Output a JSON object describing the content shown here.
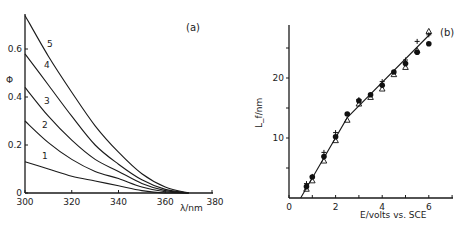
{
  "chart_data": [
    {
      "panel": "(a)",
      "type": "line",
      "title": "",
      "xlabel": "λ/nm",
      "ylabel": "Φ",
      "xlim": [
        300,
        380
      ],
      "ylim": [
        0,
        0.75
      ],
      "xticks": [
        300,
        320,
        340,
        360,
        380
      ],
      "yticks": [
        0,
        0.2,
        0.4,
        0.6
      ],
      "ytick_labels": [
        "0",
        "0.2",
        "0.4",
        "0.6"
      ],
      "grid": false,
      "x": [
        300,
        310,
        320,
        330,
        340,
        350,
        360,
        370
      ],
      "series": [
        {
          "name": "1",
          "values": [
            0.13,
            0.1,
            0.07,
            0.05,
            0.03,
            0.01,
            0.0,
            0.0
          ]
        },
        {
          "name": "2",
          "values": [
            0.3,
            0.21,
            0.14,
            0.09,
            0.06,
            0.025,
            0.005,
            0.0
          ]
        },
        {
          "name": "3",
          "values": [
            0.44,
            0.32,
            0.22,
            0.14,
            0.09,
            0.04,
            0.01,
            0.0
          ]
        },
        {
          "name": "4",
          "values": [
            0.58,
            0.45,
            0.32,
            0.2,
            0.12,
            0.055,
            0.015,
            0.0
          ]
        },
        {
          "name": "5",
          "values": [
            0.74,
            0.57,
            0.42,
            0.28,
            0.17,
            0.08,
            0.025,
            0.0
          ]
        }
      ]
    },
    {
      "panel": "(b)",
      "type": "scatter",
      "title": "",
      "xlabel": "E/volts  vs. SCE",
      "ylabel": "L_f/nm",
      "xlim": [
        0,
        7
      ],
      "ylim": [
        0,
        29
      ],
      "xticks": [
        0,
        1,
        2,
        3,
        4,
        5,
        6,
        7
      ],
      "xtick_labels": [
        "0",
        "",
        "2",
        "",
        "4",
        "",
        "6",
        ""
      ],
      "yticks": [
        5,
        10,
        15,
        20,
        25
      ],
      "ytick_labels": [
        "",
        "10",
        "",
        "20",
        ""
      ],
      "grid": false,
      "series": [
        {
          "name": "filled circles",
          "marker": "●",
          "x": [
            0.75,
            1.0,
            1.5,
            2.0,
            2.5,
            3.0,
            3.5,
            4.0,
            4.5,
            5.0,
            5.5,
            6.0
          ],
          "values": [
            1.9,
            3.5,
            6.9,
            10.2,
            14.0,
            16.2,
            17.2,
            18.8,
            21.0,
            22.4,
            24.3,
            25.7
          ]
        },
        {
          "name": "open triangles",
          "marker": "△",
          "x": [
            0.75,
            1.0,
            1.5,
            2.0,
            2.5,
            3.0,
            3.5,
            4.0,
            4.5,
            5.0,
            5.5,
            6.0
          ],
          "values": [
            1.5,
            2.9,
            6.2,
            9.6,
            13.0,
            15.7,
            16.8,
            18.2,
            20.6,
            21.8,
            24.6,
            27.8
          ]
        },
        {
          "name": "crosses",
          "marker": "+",
          "x": [
            0.75,
            1.0,
            1.5,
            2.0,
            3.0,
            4.0,
            5.0,
            5.5,
            6.0
          ],
          "values": [
            2.4,
            3.6,
            7.6,
            10.9,
            16.4,
            19.4,
            23.0,
            26.1,
            27.2
          ]
        },
        {
          "name": "fit line",
          "marker": "line",
          "x": [
            0.5,
            2.5,
            6.1
          ],
          "values": [
            0.0,
            13.4,
            27.5
          ]
        }
      ]
    }
  ],
  "panels": {
    "a": {
      "label": "(a)",
      "ylabel": "Φ",
      "xlabel": "λ/nm",
      "yticks": [
        "0",
        "0.2",
        "0.4",
        "0.6"
      ],
      "xticks": [
        "300",
        "320",
        "340",
        "360",
        "380"
      ],
      "curve_labels": [
        "1",
        "2",
        "3",
        "4",
        "5"
      ]
    },
    "b": {
      "label": "(b)",
      "ylabel": "L_f/nm",
      "xlabel": "E/volts  vs. SCE",
      "yticks": [
        "10",
        "20"
      ],
      "xticks": [
        "0",
        "2",
        "4",
        "6"
      ]
    }
  }
}
